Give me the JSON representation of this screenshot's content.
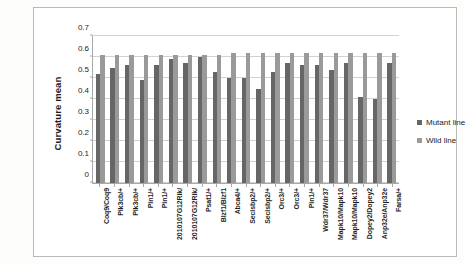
{
  "chart_data": {
    "type": "bar",
    "title": "",
    "xlabel": "",
    "ylabel": "Curvature mean",
    "ylim": [
      0,
      0.7
    ],
    "yticks": [
      "0",
      "0.1",
      "0.2",
      "0.3",
      "0.4",
      "0.5",
      "0.6",
      "0.7"
    ],
    "grid": true,
    "legend_position": "right",
    "categories": [
      "Coq9/Coq9",
      "Pik3cb/+",
      "Pik3cb/+",
      "Pin1/+",
      "Pin1/+",
      "2010107G12Rik/",
      "2010107G12Rik/",
      "Psat1/+",
      "Blzf1/Blzf1",
      "Abca4/+",
      "Secisbp2/+",
      "Secisbp2/+",
      "Orc3/+",
      "Orc3/+",
      "Pin1/+",
      "Wdr37/Wdr37",
      "Mapk10/Mapk10",
      "Mapk10/Mapk10",
      "Dopey2/Dopey2",
      "Anp32e/Anp32e",
      "Farsa/+"
    ],
    "series": [
      {
        "name": "Mutant line",
        "color": "#666666",
        "values": [
          0.52,
          0.55,
          0.56,
          0.49,
          0.56,
          0.59,
          0.57,
          0.6,
          0.53,
          0.5,
          0.5,
          0.45,
          0.53,
          0.57,
          0.56,
          0.56,
          0.54,
          0.57,
          0.41,
          0.4,
          0.57
        ]
      },
      {
        "name": "Wild line",
        "color": "#9a9a9a",
        "values": [
          0.61,
          0.61,
          0.61,
          0.61,
          0.61,
          0.61,
          0.61,
          0.61,
          0.61,
          0.62,
          0.62,
          0.62,
          0.62,
          0.62,
          0.62,
          0.62,
          0.62,
          0.62,
          0.62,
          0.62,
          0.62
        ]
      }
    ]
  },
  "legend": {
    "items": [
      {
        "label": "Mutant line",
        "marker": "square-marker"
      },
      {
        "label": "Wild line",
        "marker": "square-marker"
      }
    ]
  }
}
